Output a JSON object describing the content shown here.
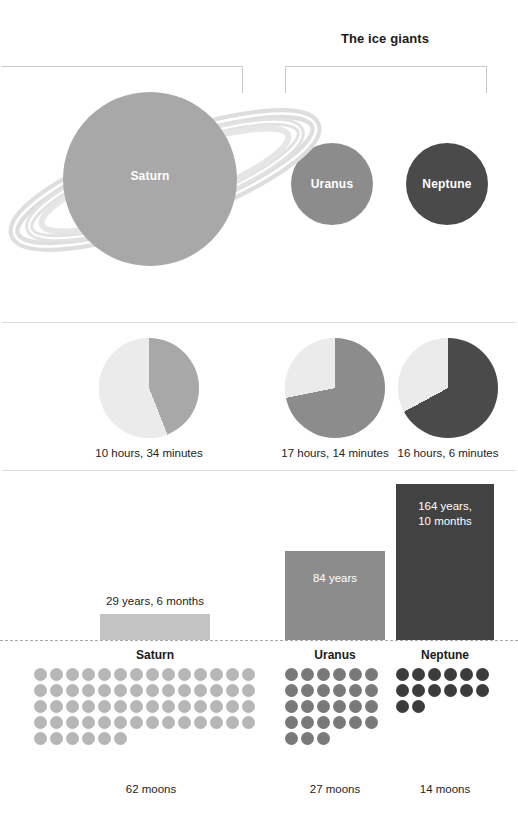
{
  "header": {
    "ice_giants_title": "The ice giants"
  },
  "colors": {
    "saturn": "#a8a8a8",
    "uranus": "#8c8c8c",
    "neptune": "#4a4a4a",
    "saturn_bar": "#c3c3c3",
    "uranus_bar": "#8c8c8c",
    "neptune_bar": "#424242",
    "pie_remainder": "#ebebeb",
    "divider": "#dcdcdc",
    "baseline": "#a9a9a9",
    "text": "#232323"
  },
  "planets": {
    "saturn": {
      "label": "Saturn"
    },
    "uranus": {
      "label": "Uranus"
    },
    "neptune": {
      "label": "Neptune"
    }
  },
  "day_length": {
    "saturn": {
      "caption": "10 hours, 34 minutes"
    },
    "uranus": {
      "caption": "17 hours, 14 minutes"
    },
    "neptune": {
      "caption": "16 hours, 6 minutes"
    }
  },
  "orbit": {
    "saturn": {
      "label": "29 years, 6 months"
    },
    "uranus": {
      "label": "84 years"
    },
    "neptune": {
      "label": "164 years,\n10 months"
    }
  },
  "moons": {
    "saturn": {
      "title": "Saturn",
      "count_label": "62 moons"
    },
    "uranus": {
      "title": "Uranus",
      "count_label": "27 moons"
    },
    "neptune": {
      "title": "Neptune",
      "count_label": "14 moons"
    }
  },
  "chart_data": [
    {
      "type": "pie",
      "title": "Length of day",
      "unit": "hours",
      "full_rotation_hours": 24,
      "items": [
        {
          "name": "Saturn",
          "value_hours": 10.567,
          "label": "10 hours, 34 minutes",
          "fraction": 0.44,
          "color": "#a8a8a8"
        },
        {
          "name": "Uranus",
          "value_hours": 17.233,
          "label": "17 hours, 14 minutes",
          "fraction": 0.718,
          "color": "#8c8c8c"
        },
        {
          "name": "Neptune",
          "value_hours": 16.1,
          "label": "16 hours, 6 minutes",
          "fraction": 0.671,
          "color": "#4a4a4a"
        }
      ],
      "legend": "none",
      "grid": false
    },
    {
      "type": "bar",
      "title": "Length of year (orbital period)",
      "categories": [
        "Saturn",
        "Uranus",
        "Neptune"
      ],
      "values": [
        29.5,
        84,
        164.83
      ],
      "value_labels": [
        "29 years, 6 months",
        "84 years",
        "164 years, 10 months"
      ],
      "ylabel": "Earth years",
      "xlabel": "",
      "ylim": [
        0,
        175
      ],
      "grid": false,
      "legend": "none",
      "colors": [
        "#c3c3c3",
        "#8c8c8c",
        "#424242"
      ]
    },
    {
      "type": "bar",
      "title": "Number of moons",
      "categories": [
        "Saturn",
        "Uranus",
        "Neptune"
      ],
      "values": [
        62,
        27,
        14
      ],
      "value_labels": [
        "62 moons",
        "27 moons",
        "14 moons"
      ],
      "ylabel": "Moons",
      "xlabel": "",
      "grid": false,
      "legend": "none",
      "representation": "pictogram-dots",
      "dots_per_row": [
        14,
        6,
        6
      ],
      "colors": [
        "#b7b7b7",
        "#797979",
        "#3c3c3c"
      ]
    },
    {
      "type": "scatter",
      "title": "Relative planet sizes",
      "categories": [
        "Saturn",
        "Uranus",
        "Neptune"
      ],
      "values": [
        174,
        82,
        82
      ],
      "ylabel": "Rendered diameter (px)",
      "xlabel": "",
      "grid": false,
      "legend": "none"
    }
  ]
}
